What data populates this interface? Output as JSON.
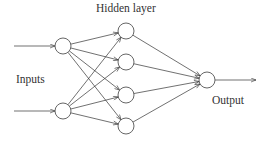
{
  "diagram": {
    "type": "neural-network",
    "labels": {
      "hidden": "Hidden layer",
      "inputs": "Inputs",
      "output": "Output"
    },
    "layers": {
      "input": [
        "i1",
        "i2"
      ],
      "hidden": [
        "h1",
        "h2",
        "h3",
        "h4"
      ],
      "output": [
        "o1"
      ]
    },
    "connections": "fully-connected",
    "external_inputs": [
      "i1",
      "i2"
    ],
    "external_outputs": [
      "o1"
    ],
    "colors": {
      "line": "#333333",
      "node_stroke": "#555555",
      "node_fill": "#ffffff"
    }
  }
}
